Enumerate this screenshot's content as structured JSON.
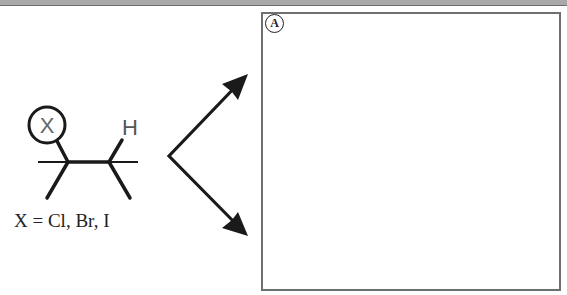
{
  "figure": {
    "molecule": {
      "substituent_label": "X",
      "hydrogen_label": "H",
      "caption": "X = Cl, Br, I"
    },
    "arrows": {
      "count": 2,
      "directions": [
        "up-right",
        "down-right"
      ]
    },
    "panel": {
      "badge_label": "A",
      "content": ""
    },
    "colors": {
      "line": "#1a1a1a",
      "label_gray": "#666666",
      "panel_border": "#6f6f6f",
      "top_bar": "#a9a9a9"
    }
  }
}
